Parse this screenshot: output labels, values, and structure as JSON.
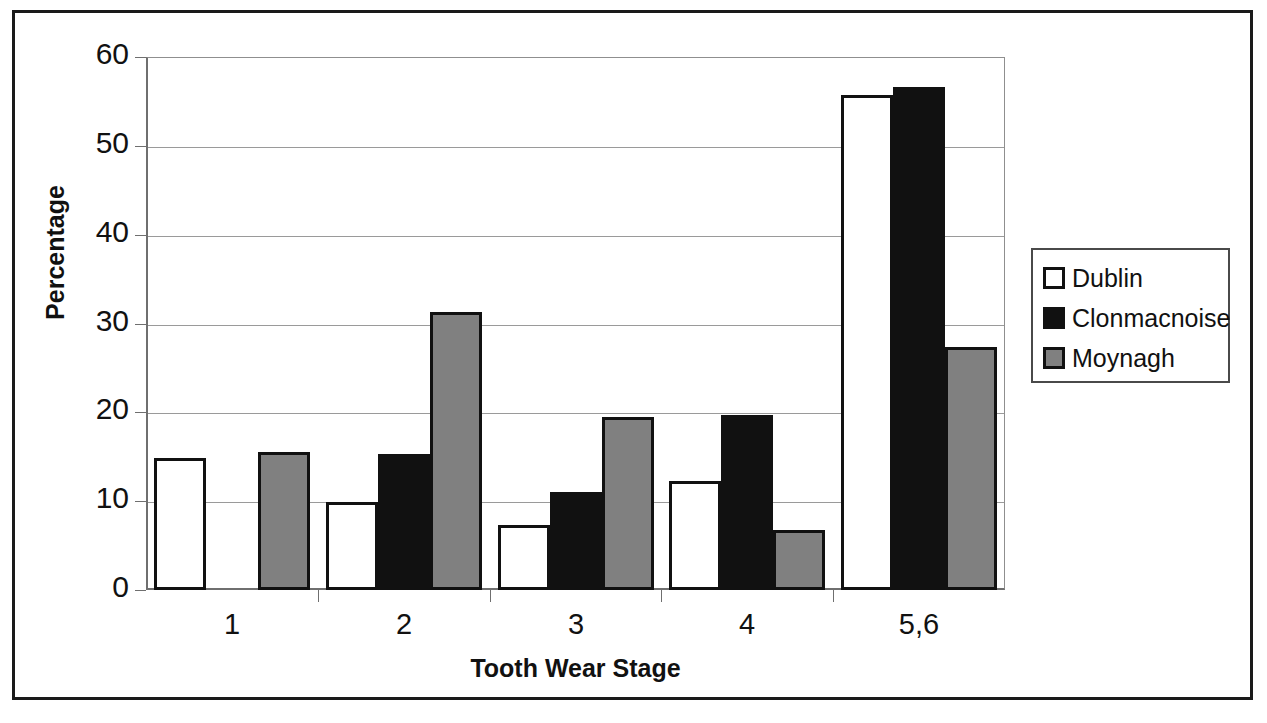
{
  "chart_data": {
    "type": "bar",
    "title": "",
    "xlabel": "Tooth Wear Stage",
    "ylabel": "Percentage",
    "categories": [
      "1",
      "2",
      "3",
      "4",
      "5,6"
    ],
    "series": [
      {
        "name": "Dublin",
        "color": "#ffffff",
        "values": [
          14.9,
          9.9,
          7.3,
          12.3,
          55.7
        ]
      },
      {
        "name": "Clonmacnoise",
        "color": "#111111",
        "values": [
          0,
          15.3,
          11.0,
          19.7,
          56.6
        ]
      },
      {
        "name": "Moynagh",
        "color": "#808080",
        "values": [
          15.5,
          31.3,
          19.5,
          6.8,
          27.3
        ]
      }
    ],
    "ylim": [
      0,
      60
    ],
    "yticks": [
      0,
      10,
      20,
      30,
      40,
      50,
      60
    ],
    "ytick_labels": [
      "0",
      "10",
      "20",
      "30",
      "40",
      "50",
      "60"
    ],
    "grid": true,
    "grid_axis": "y",
    "legend_position": "right",
    "bar_edge_color": "#111111"
  },
  "axes": {
    "y_title": "Percentage",
    "x_title": "Tooth Wear Stage"
  },
  "legend": {
    "entries": [
      {
        "label": "Dublin"
      },
      {
        "label": "Clonmacnoise"
      },
      {
        "label": "Moynagh"
      }
    ]
  }
}
